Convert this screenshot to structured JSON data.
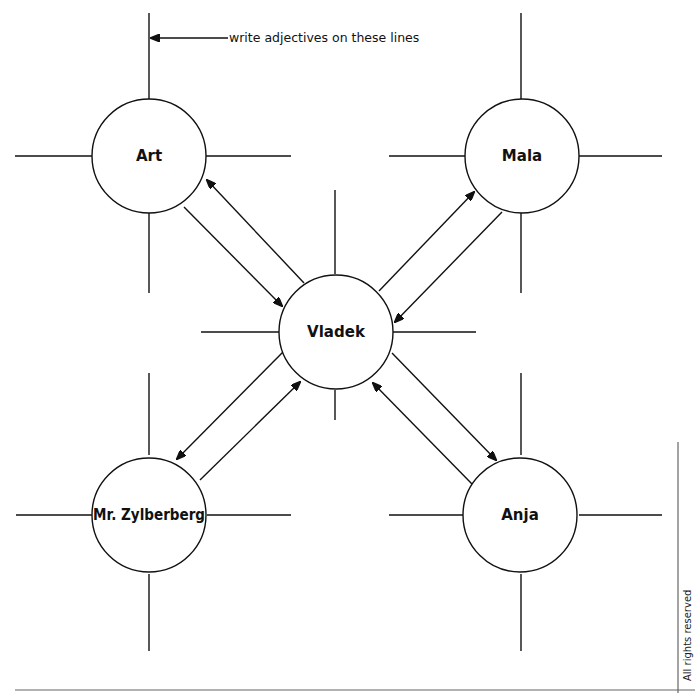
{
  "diagram": {
    "type": "character relationship web",
    "instruction": "write adjectives on these lines",
    "footer_note": "All rights reserved",
    "nodes": [
      {
        "id": "art",
        "label": "Art",
        "cx": 149,
        "cy": 156
      },
      {
        "id": "mala",
        "label": "Mala",
        "cx": 522,
        "cy": 156
      },
      {
        "id": "vladek",
        "label": "Vladek",
        "cx": 336,
        "cy": 332
      },
      {
        "id": "zylberberg",
        "label": "Mr. Zylberberg",
        "cx": 149,
        "cy": 515
      },
      {
        "id": "anja",
        "label": "Anja",
        "cx": 520,
        "cy": 515
      }
    ],
    "edges": [
      {
        "from": "vladek",
        "to": "art",
        "bidirectional_pair": true
      },
      {
        "from": "art",
        "to": "vladek",
        "bidirectional_pair": true
      },
      {
        "from": "vladek",
        "to": "mala",
        "bidirectional_pair": true
      },
      {
        "from": "mala",
        "to": "vladek",
        "bidirectional_pair": true
      },
      {
        "from": "vladek",
        "to": "zylberberg",
        "bidirectional_pair": true
      },
      {
        "from": "zylberberg",
        "to": "vladek",
        "bidirectional_pair": true
      },
      {
        "from": "vladek",
        "to": "anja",
        "bidirectional_pair": true
      },
      {
        "from": "anja",
        "to": "vladek",
        "bidirectional_pair": true
      }
    ]
  }
}
